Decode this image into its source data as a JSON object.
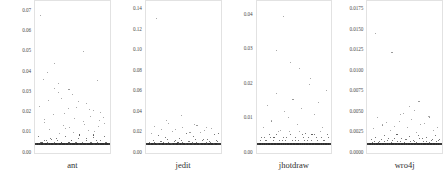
{
  "figure": {
    "title": "",
    "background": "#ffffff",
    "point_color": "#8e8e8e",
    "baseline_color": "#2e2e2e",
    "frame_color": "#e2e2e2"
  },
  "chart_data": {
    "type": "scatter",
    "title": "",
    "xlabel": "",
    "ylabel": "",
    "grid": false,
    "legend": null,
    "panels": [
      {
        "name": "ant",
        "label": "ant",
        "ylim": [
          0,
          0.075
        ],
        "yticks": [
          0.0,
          0.01,
          0.02,
          0.03,
          0.04,
          0.05,
          0.06,
          0.07
        ],
        "ytick_labels": [
          "0.00",
          "0.01",
          "0.02",
          "0.03",
          "0.04",
          "0.05",
          "0.06",
          "0.07"
        ],
        "x": [
          1,
          3,
          5,
          6,
          8,
          10,
          12,
          13,
          15,
          17,
          19,
          20,
          22,
          24,
          26,
          27,
          29,
          31,
          33,
          34,
          36,
          38,
          40,
          41,
          43,
          45,
          47,
          48,
          50,
          52,
          54,
          55,
          57,
          59,
          61,
          62,
          64,
          66,
          68,
          69,
          71,
          73,
          75,
          76,
          78,
          80,
          82,
          83,
          85,
          87,
          89,
          90,
          92,
          94,
          96,
          97,
          99,
          2,
          7,
          14,
          21,
          28,
          35,
          42,
          49,
          56,
          63,
          70,
          77,
          84,
          91,
          98,
          4,
          11,
          18,
          25,
          32,
          39,
          46,
          53,
          60,
          67,
          74,
          81,
          88,
          95,
          9,
          16,
          23,
          30,
          37,
          44,
          51,
          58,
          65,
          72,
          79,
          86,
          93,
          5,
          25,
          45,
          65,
          85,
          35,
          55,
          75,
          95,
          15,
          30,
          50,
          70,
          90,
          10,
          40,
          60,
          80,
          20
        ],
        "y": [
          0.0,
          0.0,
          0.001,
          0.0,
          0.0,
          0.002,
          0.0,
          0.0,
          0.001,
          0.0,
          0.003,
          0.0,
          0.0,
          0.001,
          0.0,
          0.0,
          0.002,
          0.0,
          0.0,
          0.001,
          0.0,
          0.0,
          0.004,
          0.0,
          0.0,
          0.001,
          0.0,
          0.002,
          0.0,
          0.0,
          0.001,
          0.0,
          0.0,
          0.003,
          0.0,
          0.0,
          0.001,
          0.0,
          0.0,
          0.002,
          0.0,
          0.0,
          0.001,
          0.0,
          0.0,
          0.005,
          0.0,
          0.0,
          0.001,
          0.0,
          0.0,
          0.002,
          0.0,
          0.0,
          0.001,
          0.0,
          0.0,
          0.004,
          0.001,
          0.002,
          0.0,
          0.003,
          0.001,
          0.0,
          0.002,
          0.001,
          0.0,
          0.003,
          0.001,
          0.002,
          0.0,
          0.001,
          0.021,
          0.012,
          0.008,
          0.031,
          0.006,
          0.017,
          0.009,
          0.014,
          0.005,
          0.011,
          0.019,
          0.007,
          0.013,
          0.004,
          0.036,
          0.024,
          0.0165,
          0.0285,
          0.0105,
          0.0195,
          0.0065,
          0.0235,
          0.0125,
          0.0075,
          0.0185,
          0.0095,
          0.0145,
          0.0715,
          0.0445,
          0.0305,
          0.0515,
          0.0355,
          0.0255,
          0.0205,
          0.0155,
          0.0115,
          0.0395,
          0.0335,
          0.0275,
          0.0225,
          0.0175,
          0.0135,
          0.0085,
          0.0055,
          0.0035,
          0.0025
        ]
      },
      {
        "name": "jedit",
        "label": "jedit",
        "ylim": [
          0,
          0.148
        ],
        "yticks": [
          0.0,
          0.02,
          0.04,
          0.06,
          0.08,
          0.1,
          0.12,
          0.14
        ],
        "ytick_labels": [
          "0.00",
          "0.02",
          "0.04",
          "0.06",
          "0.08",
          "0.10",
          "0.12",
          "0.14"
        ],
        "x": [
          1,
          2,
          4,
          6,
          7,
          9,
          11,
          12,
          14,
          16,
          17,
          19,
          21,
          22,
          24,
          26,
          27,
          29,
          31,
          32,
          34,
          36,
          37,
          39,
          41,
          42,
          44,
          46,
          47,
          49,
          51,
          52,
          54,
          56,
          57,
          59,
          61,
          62,
          64,
          66,
          67,
          69,
          71,
          72,
          74,
          76,
          77,
          79,
          81,
          82,
          84,
          86,
          87,
          89,
          91,
          92,
          94,
          96,
          97,
          99,
          3,
          8,
          13,
          18,
          23,
          28,
          33,
          38,
          43,
          48,
          53,
          58,
          63,
          68,
          73,
          78,
          83,
          88,
          93,
          98,
          5,
          15,
          25,
          35,
          45,
          55,
          65,
          75,
          85,
          95,
          10,
          20,
          30,
          40,
          50,
          60,
          70,
          80,
          90,
          100,
          27,
          48,
          66,
          84,
          12
        ],
        "y": [
          0.0,
          0.0,
          0.001,
          0.0,
          0.0,
          0.002,
          0.0,
          0.0,
          0.001,
          0.0,
          0.0,
          0.003,
          0.0,
          0.0,
          0.001,
          0.0,
          0.0,
          0.002,
          0.0,
          0.0,
          0.001,
          0.0,
          0.0,
          0.004,
          0.0,
          0.0,
          0.001,
          0.0,
          0.0,
          0.002,
          0.0,
          0.0,
          0.001,
          0.0,
          0.0,
          0.003,
          0.0,
          0.0,
          0.001,
          0.0,
          0.0,
          0.002,
          0.0,
          0.0,
          0.001,
          0.0,
          0.0,
          0.005,
          0.0,
          0.0,
          0.001,
          0.0,
          0.0,
          0.002,
          0.0,
          0.0,
          0.001,
          0.0,
          0.0,
          0.003,
          0.002,
          0.004,
          0.001,
          0.003,
          0.002,
          0.005,
          0.001,
          0.003,
          0.002,
          0.004,
          0.001,
          0.003,
          0.002,
          0.005,
          0.001,
          0.004,
          0.002,
          0.003,
          0.001,
          0.004,
          0.012,
          0.009,
          0.007,
          0.014,
          0.006,
          0.011,
          0.008,
          0.013,
          0.005,
          0.01,
          0.019,
          0.016,
          0.022,
          0.0155,
          0.0185,
          0.0125,
          0.0205,
          0.0145,
          0.0175,
          0.0115,
          0.0255,
          0.0315,
          0.0215,
          0.0185,
          0.1375
        ]
      },
      {
        "name": "jhotdraw",
        "label": "jhotdraw",
        "ylim": [
          0,
          0.044
        ],
        "yticks": [
          0.0,
          0.01,
          0.02,
          0.03,
          0.04
        ],
        "ytick_labels": [
          "0.00",
          "0.01",
          "0.02",
          "0.03",
          "0.04"
        ],
        "x": [
          1,
          2,
          3,
          5,
          6,
          8,
          9,
          11,
          12,
          14,
          15,
          17,
          18,
          20,
          21,
          23,
          24,
          26,
          27,
          29,
          30,
          32,
          33,
          35,
          36,
          38,
          39,
          41,
          42,
          44,
          45,
          47,
          48,
          50,
          51,
          53,
          54,
          56,
          57,
          59,
          60,
          62,
          63,
          65,
          66,
          68,
          69,
          71,
          72,
          74,
          75,
          77,
          78,
          80,
          81,
          83,
          84,
          86,
          87,
          89,
          90,
          92,
          93,
          95,
          96,
          98,
          99,
          4,
          10,
          16,
          22,
          28,
          34,
          40,
          46,
          52,
          58,
          64,
          70,
          76,
          82,
          88,
          94,
          100,
          7,
          19,
          31,
          43,
          55,
          67,
          79,
          91,
          13,
          25,
          37,
          49,
          61,
          73,
          85,
          97,
          36,
          58,
          74,
          26,
          46
        ],
        "y": [
          0.0,
          0.0,
          0.001,
          0.0,
          0.0,
          0.002,
          0.0,
          0.0,
          0.001,
          0.0,
          0.0,
          0.002,
          0.0,
          0.0,
          0.001,
          0.0,
          0.0,
          0.003,
          0.0,
          0.0,
          0.001,
          0.0,
          0.0,
          0.002,
          0.0,
          0.0,
          0.001,
          0.0,
          0.0,
          0.004,
          0.0,
          0.0,
          0.001,
          0.0,
          0.0,
          0.002,
          0.0,
          0.0,
          0.001,
          0.0,
          0.0,
          0.003,
          0.0,
          0.0,
          0.001,
          0.0,
          0.0,
          0.002,
          0.0,
          0.0,
          0.001,
          0.0,
          0.0,
          0.003,
          0.0,
          0.0,
          0.001,
          0.0,
          0.0,
          0.002,
          0.0,
          0.0,
          0.001,
          0.0,
          0.0,
          0.003,
          0.0,
          0.002,
          0.001,
          0.003,
          0.002,
          0.004,
          0.001,
          0.002,
          0.003,
          0.001,
          0.004,
          0.002,
          0.001,
          0.003,
          0.002,
          0.004,
          0.001,
          0.002,
          0.0055,
          0.0075,
          0.0045,
          0.0085,
          0.0065,
          0.0035,
          0.0095,
          0.0055,
          0.0125,
          0.0165,
          0.0105,
          0.0145,
          0.0115,
          0.0195,
          0.0135,
          0.0175,
          0.0415,
          0.0245,
          0.0215,
          0.0305,
          0.0265
        ]
      },
      {
        "name": "wro4j",
        "label": "wro4j",
        "ylim": [
          0,
          0.0185
        ],
        "yticks": [
          0.0,
          0.0025,
          0.005,
          0.0075,
          0.01,
          0.0125,
          0.015,
          0.0175
        ],
        "ytick_labels": [
          "0.0000",
          "0.0025",
          "0.0050",
          "0.0075",
          "0.0100",
          "0.0125",
          "0.0150",
          "0.0175"
        ],
        "x": [
          1,
          2,
          4,
          5,
          7,
          8,
          10,
          11,
          13,
          14,
          16,
          17,
          19,
          20,
          22,
          23,
          25,
          26,
          28,
          29,
          31,
          32,
          34,
          35,
          37,
          38,
          40,
          41,
          43,
          44,
          46,
          47,
          49,
          50,
          52,
          53,
          55,
          56,
          58,
          59,
          61,
          62,
          64,
          65,
          67,
          68,
          70,
          71,
          73,
          74,
          76,
          77,
          79,
          80,
          82,
          83,
          85,
          86,
          88,
          89,
          91,
          92,
          94,
          95,
          97,
          98,
          3,
          9,
          15,
          21,
          27,
          33,
          39,
          45,
          51,
          57,
          63,
          69,
          75,
          81,
          87,
          93,
          99,
          6,
          18,
          30,
          42,
          54,
          66,
          78,
          90,
          12,
          24,
          36,
          48,
          60,
          72,
          84,
          96,
          64,
          70,
          57,
          44,
          85,
          32,
          9
        ],
        "y": [
          0.0,
          0.0,
          0.0002,
          0.0,
          0.0,
          0.0004,
          0.0,
          0.0,
          0.0002,
          0.0,
          0.0,
          0.0006,
          0.0,
          0.0,
          0.0003,
          0.0,
          0.0,
          0.0005,
          0.0,
          0.0,
          0.0002,
          0.0,
          0.0,
          0.0007,
          0.0,
          0.0,
          0.0003,
          0.0,
          0.0,
          0.0004,
          0.0,
          0.0,
          0.0002,
          0.0,
          0.0,
          0.0006,
          0.0,
          0.0,
          0.0003,
          0.0,
          0.0,
          0.0005,
          0.0,
          0.0,
          0.0002,
          0.0,
          0.0,
          0.0008,
          0.0,
          0.0,
          0.0003,
          0.0,
          0.0,
          0.0004,
          0.0,
          0.0,
          0.0002,
          0.0,
          0.0,
          0.0006,
          0.0,
          0.0,
          0.0003,
          0.0,
          0.0,
          0.0005,
          0.0006,
          0.0009,
          0.0004,
          0.0011,
          0.0007,
          0.0005,
          0.0013,
          0.0008,
          0.0006,
          0.001,
          0.0004,
          0.0012,
          0.0007,
          0.0009,
          0.0005,
          0.0011,
          0.0006,
          0.0021,
          0.0026,
          0.0018,
          0.0031,
          0.0023,
          0.0016,
          0.0028,
          0.0019,
          0.0036,
          0.0029,
          0.0024,
          0.0042,
          0.0033,
          0.0027,
          0.0038,
          0.0022,
          0.0046,
          0.0058,
          0.0052,
          0.0041,
          0.0037,
          0.0126,
          0.0152,
          0.0176
        ]
      }
    ]
  }
}
